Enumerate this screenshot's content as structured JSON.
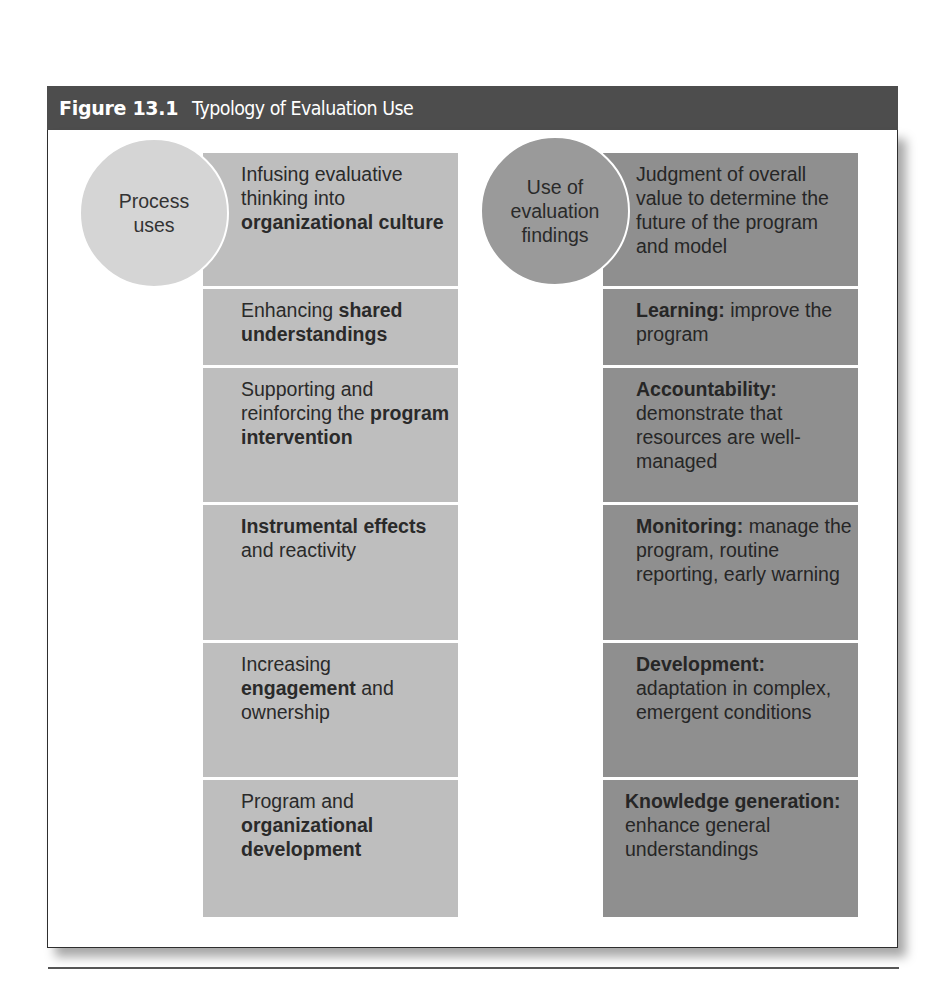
{
  "figure": {
    "number": "Figure 13.1",
    "title": "Typology of Evaluation Use"
  },
  "process_uses": {
    "circle_label_lines": [
      "Process",
      "uses"
    ],
    "color": "#bebebe",
    "items": [
      {
        "segments": [
          {
            "text": "Infusing evaluative thinking into ",
            "bold": false
          },
          {
            "text": "organizational culture",
            "bold": true
          }
        ]
      },
      {
        "segments": [
          {
            "text": "Enhancing ",
            "bold": false
          },
          {
            "text": "shared understandings",
            "bold": true
          }
        ]
      },
      {
        "segments": [
          {
            "text": "Supporting and reinforcing the ",
            "bold": false
          },
          {
            "text": "program intervention",
            "bold": true
          }
        ]
      },
      {
        "segments": [
          {
            "text": "Instrumental effects",
            "bold": true
          },
          {
            "text": " and reactivity",
            "bold": false
          }
        ]
      },
      {
        "segments": [
          {
            "text": "Increasing ",
            "bold": false
          },
          {
            "text": "engagement",
            "bold": true
          },
          {
            "text": " and ownership",
            "bold": false
          }
        ]
      },
      {
        "segments": [
          {
            "text": "Program and ",
            "bold": false
          },
          {
            "text": "organizational development",
            "bold": true
          }
        ]
      }
    ]
  },
  "findings_uses": {
    "circle_label_lines": [
      "Use of",
      "evaluation",
      "findings"
    ],
    "color": "#8f8f8f",
    "items": [
      {
        "segments": [
          {
            "text": "Judgment of overall value to determine the future of the program and model",
            "bold": false
          }
        ]
      },
      {
        "segments": [
          {
            "text": "Learning:",
            "bold": true
          },
          {
            "text": " improve the program",
            "bold": false
          }
        ]
      },
      {
        "segments": [
          {
            "text": "Accountability:",
            "bold": true
          },
          {
            "text": " demonstrate that resources are well-managed",
            "bold": false
          }
        ]
      },
      {
        "segments": [
          {
            "text": "Monitoring:",
            "bold": true
          },
          {
            "text": " manage the program, routine reporting, early warning",
            "bold": false
          }
        ]
      },
      {
        "segments": [
          {
            "text": "Development:",
            "bold": true
          },
          {
            "text": " adaptation in complex, emergent conditions",
            "bold": false
          }
        ]
      },
      {
        "segments": [
          {
            "text": "Knowledge generation:",
            "bold": true
          },
          {
            "text": " enhance general understandings",
            "bold": false
          }
        ]
      }
    ]
  },
  "colors": {
    "header_bg": "#4d4d4d",
    "header_text": "#ffffff",
    "left_circle": "#d5d5d5",
    "right_circle": "#9a9a9a"
  }
}
